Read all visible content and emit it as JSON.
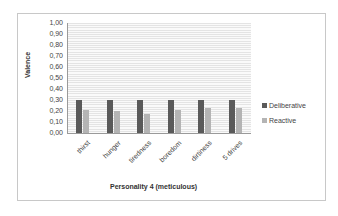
{
  "chart_data": {
    "type": "bar",
    "title": "",
    "xlabel": "Personality 4 (meticulous)",
    "ylabel": "Valence",
    "ylim": [
      0,
      1.0
    ],
    "yticks": [
      "0,00",
      "0,10",
      "0,20",
      "0,30",
      "0,40",
      "0,50",
      "0,60",
      "0,70",
      "0,80",
      "0,90",
      "1,00"
    ],
    "grid": true,
    "legend_position": "right",
    "categories": [
      "thirst",
      "hunger",
      "tiredness",
      "boredom",
      "dirtiness",
      "5 drives"
    ],
    "series": [
      {
        "name": "Deliberative",
        "color": "#5a5a5a",
        "values": [
          0.3,
          0.3,
          0.3,
          0.3,
          0.3,
          0.3
        ]
      },
      {
        "name": "Reactive",
        "color": "#b4b4b4",
        "values": [
          0.21,
          0.2,
          0.17,
          0.21,
          0.23,
          0.23
        ]
      }
    ]
  }
}
